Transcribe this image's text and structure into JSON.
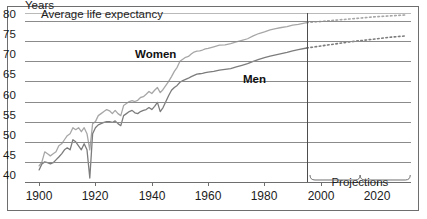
{
  "figure": {
    "y_axis_title": "Years",
    "subtitle": "Average life expectancy",
    "projections_label": "Projections"
  },
  "series_labels": {
    "women": "Women",
    "men": "Men"
  },
  "chart_data": {
    "type": "line",
    "title": "Average life expectancy",
    "xlabel": "",
    "ylabel": "Years",
    "xlim": [
      1895,
      2032
    ],
    "ylim": [
      40,
      82
    ],
    "grid": true,
    "legend": "inline-annotations",
    "y_ticks": [
      40,
      45,
      50,
      55,
      60,
      65,
      70,
      75,
      80
    ],
    "x_ticks": [
      1900,
      1920,
      1940,
      1960,
      1980,
      2000,
      2020
    ],
    "projection_start_year": 1995,
    "annotations": [
      {
        "text": "Years",
        "position": "above-y-axis"
      },
      {
        "text": "Average life expectancy",
        "position": "beside-80-tick"
      },
      {
        "text": "Women",
        "position": "upper-left-of-women-line"
      },
      {
        "text": "Men",
        "position": "right-of-men-line"
      },
      {
        "text": "Projections",
        "position": "below-axis-after-1995",
        "brace": true
      }
    ],
    "series": [
      {
        "name": "Women",
        "style": "solid",
        "color": "#a7a7a7",
        "x": [
          1900,
          1901,
          1902,
          1903,
          1904,
          1905,
          1906,
          1907,
          1908,
          1909,
          1910,
          1911,
          1912,
          1913,
          1914,
          1915,
          1916,
          1917,
          1918,
          1919,
          1920,
          1921,
          1922,
          1923,
          1924,
          1925,
          1926,
          1927,
          1928,
          1929,
          1930,
          1931,
          1932,
          1933,
          1934,
          1935,
          1936,
          1937,
          1938,
          1939,
          1940,
          1941,
          1942,
          1943,
          1944,
          1945,
          1946,
          1947,
          1948,
          1949,
          1950,
          1951,
          1952,
          1953,
          1954,
          1955,
          1956,
          1957,
          1958,
          1959,
          1960,
          1962,
          1964,
          1966,
          1968,
          1970,
          1972,
          1974,
          1976,
          1978,
          1980,
          1982,
          1984,
          1986,
          1988,
          1990,
          1992,
          1995
        ],
        "values": [
          44.0,
          45.0,
          47.5,
          47.0,
          46.5,
          47.0,
          47.5,
          49.0,
          49.5,
          50.5,
          51.5,
          52.0,
          53.5,
          53.0,
          53.5,
          52.5,
          53.5,
          52.0,
          48.0,
          54.5,
          55.0,
          56.5,
          57.0,
          57.5,
          58.0,
          57.7,
          57.0,
          57.8,
          57.0,
          56.5,
          59.0,
          59.5,
          60.0,
          60.2,
          60.0,
          60.3,
          61.0,
          61.2,
          61.8,
          62.5,
          62.0,
          62.8,
          63.5,
          62.2,
          63.0,
          64.0,
          65.0,
          66.2,
          67.5,
          68.5,
          70.0,
          70.5,
          71.0,
          71.2,
          71.8,
          72.3,
          72.5,
          72.6,
          72.8,
          73.1,
          73.2,
          73.6,
          74.0,
          74.1,
          74.4,
          74.8,
          75.2,
          75.6,
          76.3,
          76.9,
          77.3,
          77.8,
          78.1,
          78.4,
          78.6,
          79.0,
          79.2,
          79.6
        ]
      },
      {
        "name": "Women (projection)",
        "style": "dotted",
        "color": "#a7a7a7",
        "x": [
          1995,
          2000,
          2005,
          2010,
          2015,
          2020,
          2025,
          2030
        ],
        "values": [
          79.6,
          79.9,
          80.2,
          80.5,
          80.8,
          81.1,
          81.3,
          81.5
        ]
      },
      {
        "name": "Men",
        "style": "solid",
        "color": "#7c7c7c",
        "x": [
          1900,
          1901,
          1902,
          1903,
          1904,
          1905,
          1906,
          1907,
          1908,
          1909,
          1910,
          1911,
          1912,
          1913,
          1914,
          1915,
          1916,
          1917,
          1918,
          1919,
          1920,
          1921,
          1922,
          1923,
          1924,
          1925,
          1926,
          1927,
          1928,
          1929,
          1930,
          1931,
          1932,
          1933,
          1934,
          1935,
          1936,
          1937,
          1938,
          1939,
          1940,
          1941,
          1942,
          1943,
          1944,
          1945,
          1946,
          1947,
          1948,
          1949,
          1950,
          1951,
          1952,
          1953,
          1954,
          1955,
          1956,
          1957,
          1958,
          1959,
          1960,
          1962,
          1964,
          1966,
          1968,
          1970,
          1972,
          1974,
          1976,
          1978,
          1980,
          1982,
          1984,
          1986,
          1988,
          1990,
          1992,
          1995
        ],
        "values": [
          43.0,
          44.5,
          45.0,
          44.8,
          44.5,
          44.8,
          45.5,
          46.2,
          47.0,
          48.0,
          48.5,
          48.0,
          50.5,
          50.0,
          49.0,
          48.0,
          49.5,
          48.0,
          41.0,
          52.0,
          53.5,
          54.2,
          54.5,
          54.8,
          55.0,
          55.0,
          54.8,
          55.2,
          54.5,
          54.0,
          56.5,
          57.0,
          57.5,
          57.8,
          57.2,
          57.0,
          57.5,
          57.8,
          58.0,
          58.5,
          58.0,
          58.8,
          59.8,
          57.5,
          58.5,
          60.0,
          61.5,
          62.8,
          63.5,
          64.0,
          64.8,
          65.2,
          65.5,
          65.8,
          66.2,
          66.5,
          66.8,
          66.9,
          67.0,
          67.2,
          67.3,
          67.5,
          67.8,
          68.0,
          68.2,
          68.6,
          69.0,
          69.4,
          70.0,
          70.5,
          70.9,
          71.3,
          71.6,
          71.9,
          72.2,
          72.6,
          72.9,
          73.3
        ]
      },
      {
        "name": "Men (projection)",
        "style": "dotted",
        "color": "#7c7c7c",
        "x": [
          1995,
          2000,
          2005,
          2010,
          2015,
          2020,
          2025,
          2030
        ],
        "values": [
          73.3,
          73.8,
          74.3,
          74.8,
          75.2,
          75.6,
          76.0,
          76.3
        ]
      }
    ]
  },
  "colors": {
    "frame": "#6e6e6e",
    "gridline": "#8b8b8b",
    "divider": "#4d4d4d",
    "women_line": "#a7a7a7",
    "men_line": "#7c7c7c",
    "text": "#1c1c1c"
  }
}
